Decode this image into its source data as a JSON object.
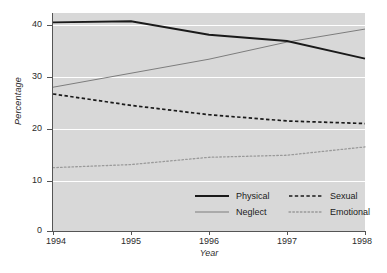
{
  "chart_data": {
    "type": "line",
    "title": "",
    "xlabel": "Year",
    "ylabel": "Percentage",
    "x": [
      1994,
      1995,
      1996,
      1997,
      1998
    ],
    "xtick_labels": [
      "1994",
      "1995",
      "1996",
      "1997",
      "1998"
    ],
    "ytick_labels": [
      "0",
      "10",
      "20",
      "30",
      "40"
    ],
    "ytick_values": [
      0,
      10,
      20,
      30,
      40
    ],
    "xlim": [
      1994,
      1998
    ],
    "ylim": [
      0,
      42
    ],
    "grid": "horizontal-white",
    "legend_position": "lower-right-inside",
    "series": [
      {
        "name": "Physical",
        "values": [
          40.2,
          40.4,
          37.8,
          36.6,
          33.2
        ],
        "style": "solid",
        "color": "#1a1a1a",
        "width": 1.9
      },
      {
        "name": "Neglect",
        "values": [
          27.7,
          30.4,
          33.1,
          36.4,
          38.9
        ],
        "style": "solid",
        "color": "#7d7d7d",
        "width": 1.0
      },
      {
        "name": "Sexual",
        "values": [
          26.4,
          24.2,
          22.4,
          21.2,
          20.7
        ],
        "style": "dashed",
        "color": "#1a1a1a",
        "width": 1.7
      },
      {
        "name": "Emotional",
        "values": [
          12.2,
          12.8,
          14.2,
          14.6,
          16.2
        ],
        "style": "dotted",
        "color": "#9a9a9a",
        "width": 1.3
      }
    ]
  },
  "legend": {
    "entries": [
      {
        "label": "Physical",
        "swatch": "solid-dark-line-icon"
      },
      {
        "label": "Sexual",
        "swatch": "dashed-dark-line-icon"
      },
      {
        "label": "Neglect",
        "swatch": "solid-gray-line-icon"
      },
      {
        "label": "Emotional",
        "swatch": "dotted-gray-line-icon"
      }
    ]
  },
  "colors": {
    "plot_background": "#d8d8d8",
    "page_background": "#ffffff",
    "gridline": "#ffffff",
    "axis": "#555555",
    "dark_series": "#1a1a1a",
    "gray_series": "#7d7d7d",
    "light_gray_series": "#9a9a9a"
  }
}
